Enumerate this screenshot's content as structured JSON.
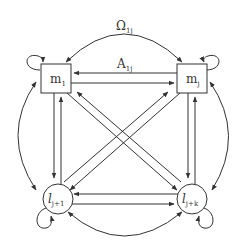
{
  "diagram": {
    "type": "directed-graph",
    "stroke_color": "#333333",
    "background": "#ffffff",
    "nodes": [
      {
        "id": "m1",
        "shape": "square",
        "label": "m",
        "sub": "1"
      },
      {
        "id": "mj",
        "shape": "square",
        "label": "m",
        "sub": "j"
      },
      {
        "id": "lj1",
        "shape": "circle",
        "label": "l",
        "sub": "j+1"
      },
      {
        "id": "ljk",
        "shape": "circle",
        "label": "l",
        "sub": "j+k"
      }
    ],
    "edge_labels": {
      "omega": {
        "text": "Ω",
        "sub": "1j"
      },
      "a": {
        "text": "A",
        "sub": "1j"
      }
    },
    "edges": [
      {
        "from": "m1",
        "to": "mj",
        "style": "curved-bidirectional",
        "label": "Ω1j"
      },
      {
        "from": "mj",
        "to": "m1",
        "style": "straight",
        "label": "A1j"
      },
      {
        "from": "m1",
        "to": "mj",
        "style": "straight"
      },
      {
        "from": "m1",
        "to": "lj1",
        "style": "straight"
      },
      {
        "from": "lj1",
        "to": "m1",
        "style": "straight"
      },
      {
        "from": "mj",
        "to": "ljk",
        "style": "straight"
      },
      {
        "from": "ljk",
        "to": "mj",
        "style": "straight"
      },
      {
        "from": "m1",
        "to": "ljk",
        "style": "straight"
      },
      {
        "from": "ljk",
        "to": "m1",
        "style": "straight"
      },
      {
        "from": "mj",
        "to": "lj1",
        "style": "straight"
      },
      {
        "from": "lj1",
        "to": "mj",
        "style": "straight"
      },
      {
        "from": "ljk",
        "to": "lj1",
        "style": "straight"
      },
      {
        "from": "lj1",
        "to": "ljk",
        "style": "straight"
      },
      {
        "from": "lj1",
        "to": "ljk",
        "style": "curved-bidirectional"
      },
      {
        "from": "m1",
        "to": "lj1",
        "style": "curved-bidirectional-left"
      },
      {
        "from": "mj",
        "to": "ljk",
        "style": "curved-bidirectional-right"
      },
      {
        "from": "m1",
        "to": "m1",
        "style": "self-loop"
      },
      {
        "from": "mj",
        "to": "mj",
        "style": "self-loop"
      },
      {
        "from": "lj1",
        "to": "lj1",
        "style": "self-loop"
      },
      {
        "from": "ljk",
        "to": "ljk",
        "style": "self-loop"
      }
    ]
  }
}
